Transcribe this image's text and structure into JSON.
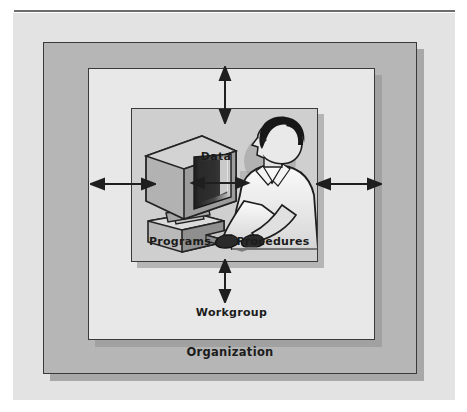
{
  "figure": {
    "caption_ghost": "",
    "boxes": {
      "organization": {
        "label": "Organization"
      },
      "workgroup": {
        "label": "Workgroup"
      },
      "information_system": {
        "label": ""
      }
    },
    "inner_labels": {
      "data": "Data",
      "programs": "Programs",
      "procedures": "Procedures"
    },
    "arrows": {
      "top": "double-headed-vertical-arrow",
      "bottom": "double-headed-vertical-arrow",
      "left": "double-headed-horizontal-arrow",
      "right": "double-headed-horizontal-arrow",
      "data": "double-headed-horizontal-arrow"
    },
    "illustration": {
      "name": "person-at-computer-workstation",
      "monitor": "crt-monitor-icon",
      "keyboard": "keyboard-icon",
      "person": "person-profile-icon"
    },
    "colors": {
      "page_background": "#ffffff",
      "outer_panel": "#e3e3e3",
      "organization_fill": "#b6b6b6",
      "workgroup_fill": "#e8e8e8",
      "information_system_fill": "#cfcfcf",
      "border": "#3a3a3a",
      "rule": "#6d6d6d",
      "label_text": "#1c1c1c"
    }
  }
}
